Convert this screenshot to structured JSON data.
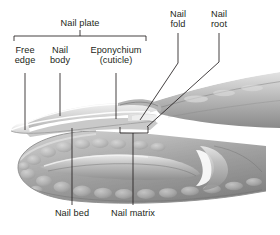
{
  "figure": {
    "background_color": "#ffffff",
    "line_color": "#231f20",
    "text_color": "#231f20"
  },
  "bracket": {
    "label": "Nail plate",
    "covers": [
      "Free edge",
      "Nail body",
      "Eponychium (cuticle)"
    ]
  },
  "labels": {
    "nail_plate": "Nail plate",
    "free_edge_l1": "Free",
    "free_edge_l2": "edge",
    "nail_body_l1": "Nail",
    "nail_body_l2": "body",
    "eponychium_l1": "Eponychium",
    "eponychium_l2": "(cuticle)",
    "nail_fold_l1": "Nail",
    "nail_fold_l2": "fold",
    "nail_root_l1": "Nail",
    "nail_root_l2": "root",
    "nail_bed": "Nail bed",
    "nail_matrix": "Nail matrix"
  },
  "anatomy_parts": [
    "Nail plate",
    "Free edge",
    "Nail body",
    "Eponychium (cuticle)",
    "Nail fold",
    "Nail root",
    "Nail bed",
    "Nail matrix"
  ],
  "colors": {
    "ink": "#231f20",
    "nail_light": "#e8e8e8",
    "nail_mid": "#b9b9b9",
    "tissue_light": "#d2d2d2",
    "tissue_mid": "#a8a8a8",
    "tissue_dark": "#7c7c7c",
    "background": "#ffffff"
  }
}
